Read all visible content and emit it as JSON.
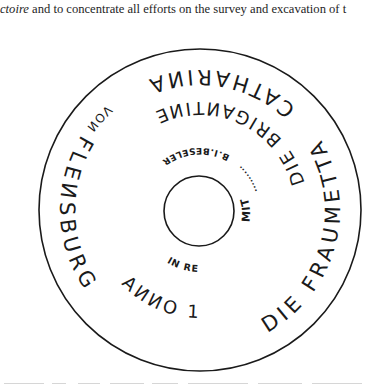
{
  "document": {
    "top_line": {
      "italic_part": "ctoire",
      "rest": " and to concentrate all efforts on the survey and excavation of t"
    },
    "figure": {
      "type": "circular-inscription",
      "outer_ring": {
        "segment_1": "DIE FRAUMETTA",
        "segment_2": "CATHARIИA",
        "segment_3": "VOИ",
        "segment_4": "FLEИSBURG"
      },
      "middle_ring": {
        "brigantine": "DIE BRIGAИTIИE",
        "anno": "AИИO 1782"
      },
      "inner_ring": {
        "mit": "MIT",
        "dots_1": "·········",
        "maker": "B.I.BESELER",
        "dots_2": "······",
        "place": "IN RENDSBURG"
      },
      "colors": {
        "ink": "#1a1a1a",
        "paper": "#ffffff"
      }
    }
  }
}
